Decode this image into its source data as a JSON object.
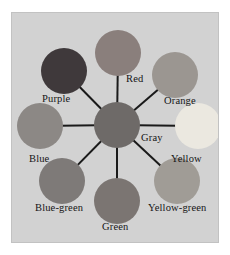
{
  "figure": {
    "type": "color-wheel-diagram",
    "panel_background": "#d2d2d2",
    "page_background": "#ffffff",
    "spoke_color": "#1a1a1a",
    "label_color": "#151515",
    "center": {
      "name": "gray",
      "label": "Gray",
      "color": "#6e6a68",
      "radius_px": 23,
      "cx": 105,
      "cy": 112,
      "label_x": 129,
      "label_y": 119
    },
    "nodes": [
      {
        "name": "red",
        "label": "Red",
        "color": "#8a7f7c",
        "angle_deg": 90,
        "radius_px": 23,
        "cx": 106,
        "cy": 40,
        "label_x": 114,
        "label_y": 60
      },
      {
        "name": "orange",
        "label": "Orange",
        "color": "#9b9691",
        "angle_deg": 45,
        "radius_px": 23,
        "cx": 163,
        "cy": 62,
        "label_x": 152,
        "label_y": 82
      },
      {
        "name": "yellow",
        "label": "Yellow",
        "color": "#ebe8e0",
        "angle_deg": 0,
        "radius_px": 23,
        "cx": 186,
        "cy": 113,
        "label_x": 159,
        "label_y": 140
      },
      {
        "name": "yellow-green",
        "label": "Yellow-green",
        "color": "#a09c96",
        "angle_deg": -45,
        "radius_px": 23,
        "cx": 165,
        "cy": 168,
        "label_x": 136,
        "label_y": 189
      },
      {
        "name": "green",
        "label": "Green",
        "color": "#7b7572",
        "angle_deg": -90,
        "radius_px": 23,
        "cx": 105,
        "cy": 188,
        "label_x": 90,
        "label_y": 208
      },
      {
        "name": "blue-green",
        "label": "Blue-green",
        "color": "#7e7a78",
        "angle_deg": -135,
        "radius_px": 23,
        "cx": 50,
        "cy": 168,
        "label_x": 23,
        "label_y": 189
      },
      {
        "name": "blue",
        "label": "Blue",
        "color": "#8c8885",
        "angle_deg": 180,
        "radius_px": 23,
        "cx": 28,
        "cy": 113,
        "label_x": 17,
        "label_y": 140
      },
      {
        "name": "purple",
        "label": "Purple",
        "color": "#3f393b",
        "angle_deg": 135,
        "radius_px": 23,
        "cx": 52,
        "cy": 58,
        "label_x": 30,
        "label_y": 80
      }
    ]
  }
}
